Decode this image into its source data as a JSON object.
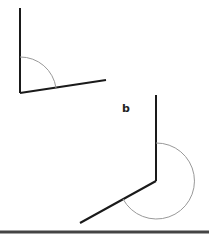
{
  "diagram": {
    "labels": {
      "b": "b"
    },
    "colors": {
      "ray": "#1a1a1a",
      "arc": "#999999",
      "rule": "#444444"
    },
    "figures": [
      {
        "id": "a",
        "vertex": [
          20,
          93
        ],
        "rays": [
          [
            20,
            8
          ],
          [
            106,
            80
          ]
        ],
        "arc_radius": 36,
        "angle_type": "acute"
      },
      {
        "id": "b",
        "vertex": [
          156,
          181
        ],
        "rays": [
          [
            156,
            95
          ],
          [
            80,
            223
          ]
        ],
        "arc_radius": 38,
        "angle_type": "reflex"
      }
    ]
  }
}
